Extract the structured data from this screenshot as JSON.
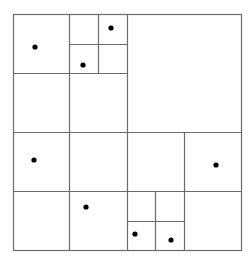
{
  "diagram": {
    "type": "quadtree",
    "line_color": "#6b6b6b",
    "point_color": "#000000",
    "bounds": {
      "x1": 13,
      "y1": 14,
      "x2": 241,
      "y2": 250
    },
    "lines": [
      {
        "x1": 69,
        "y1": 14,
        "x2": 69,
        "y2": 250
      },
      {
        "x1": 127,
        "y1": 14,
        "x2": 127,
        "y2": 250
      },
      {
        "x1": 13,
        "y1": 132,
        "x2": 241,
        "y2": 132
      },
      {
        "x1": 13,
        "y1": 73,
        "x2": 127,
        "y2": 73
      },
      {
        "x1": 13,
        "y1": 191,
        "x2": 241,
        "y2": 191
      },
      {
        "x1": 98,
        "y1": 14,
        "x2": 98,
        "y2": 73
      },
      {
        "x1": 69,
        "y1": 44,
        "x2": 127,
        "y2": 44
      },
      {
        "x1": 184,
        "y1": 132,
        "x2": 184,
        "y2": 250
      },
      {
        "x1": 155,
        "y1": 191,
        "x2": 155,
        "y2": 250
      },
      {
        "x1": 127,
        "y1": 221,
        "x2": 184,
        "y2": 221
      }
    ],
    "points": [
      {
        "x": 35,
        "y": 47
      },
      {
        "x": 111,
        "y": 28
      },
      {
        "x": 83,
        "y": 65
      },
      {
        "x": 34,
        "y": 160
      },
      {
        "x": 86,
        "y": 207
      },
      {
        "x": 216,
        "y": 165
      },
      {
        "x": 135,
        "y": 234
      },
      {
        "x": 171,
        "y": 240
      }
    ]
  }
}
